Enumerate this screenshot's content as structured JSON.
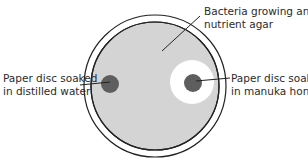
{
  "diagram": {
    "labels": {
      "agar": [
        "Bacteria growing an",
        "nutrient agar"
      ],
      "water_disc": [
        "Paper disc soaked",
        "in distilled water"
      ],
      "honey_disc": [
        "Paper disc soaked",
        "in manuka honey"
      ]
    },
    "colors": {
      "agar": "#d4d4d4",
      "disc": "#5e5e5e",
      "clear_zone": "#ffffff",
      "outline": "#222222"
    }
  }
}
